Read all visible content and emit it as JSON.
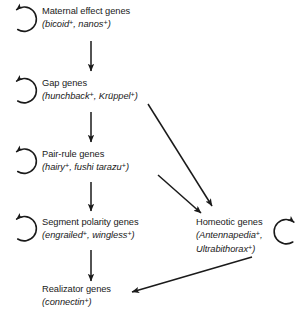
{
  "diagram": {
    "style": {
      "line_color": "#1a1a1a",
      "text_color": "#1a1a1a",
      "background": "#ffffff"
    },
    "nodes": [
      {
        "id": "maternal",
        "name": "maternal-effect-genes",
        "label": "Maternal effect genes",
        "genes_prefix": "(",
        "genes": "bicoid",
        "genes_sup": "+",
        "genes_mid": ", ",
        "genes2": "nanos",
        "genes2_sup": "+",
        "genes_suffix": ")",
        "genes_plain": "(bicoid+, nanos+)",
        "loop": "self-regulation-loop"
      },
      {
        "id": "gap",
        "name": "gap-genes",
        "label": "Gap genes",
        "genes_prefix": "(",
        "genes": "hunchback",
        "genes_sup": "+",
        "genes_mid": ", ",
        "genes2": "Krüppel",
        "genes2_sup": "+",
        "genes_suffix": ")",
        "genes_plain": "(hunchback+, Krüppel+)",
        "loop": "self-regulation-loop"
      },
      {
        "id": "pairrule",
        "name": "pair-rule-genes",
        "label": "Pair-rule genes",
        "genes_prefix": "(",
        "genes": "hairy",
        "genes_sup": "+",
        "genes_mid": ", ",
        "genes2": "fushi tarazu",
        "genes2_sup": "+",
        "genes_suffix": ")",
        "genes_plain": "(hairy+, fushi tarazu+)",
        "loop": "self-regulation-loop"
      },
      {
        "id": "segment",
        "name": "segment-polarity-genes",
        "label": "Segment polarity genes",
        "genes_prefix": "(",
        "genes": "engrailed",
        "genes_sup": "+",
        "genes_mid": ", ",
        "genes2": "wingless",
        "genes2_sup": "+",
        "genes_suffix": ")",
        "genes_plain": "(engrailed+, wingless+)",
        "loop": "self-regulation-loop"
      },
      {
        "id": "homeotic",
        "name": "homeotic-genes",
        "label": "Homeotic genes",
        "genes_prefix": "(",
        "genes": "Antennapedia",
        "genes_sup": "+",
        "genes_mid": ",",
        "genes2": "Ultrabithorax",
        "genes2_sup": "+",
        "genes_suffix": ")",
        "genes_plain": "(Antennapedia+, Ultrabithorax+)",
        "loop": "self-regulation-loop"
      },
      {
        "id": "realizator",
        "name": "realizator-genes",
        "label": "Realizator genes",
        "genes_prefix": "(",
        "genes": "connectin",
        "genes_sup": "+",
        "genes_mid": "",
        "genes2": "",
        "genes2_sup": "",
        "genes_suffix": ")",
        "genes_plain": "(connectin+)",
        "loop": "none"
      }
    ],
    "edges": [
      {
        "name": "arrow-maternal-to-gap",
        "from": "maternal",
        "to": "gap",
        "kind": "vertical"
      },
      {
        "name": "arrow-gap-to-pair-rule",
        "from": "gap",
        "to": "pairrule",
        "kind": "vertical"
      },
      {
        "name": "arrow-pair-rule-to-segment-polarity",
        "from": "pairrule",
        "to": "segment",
        "kind": "vertical"
      },
      {
        "name": "arrow-segment-polarity-to-realizator",
        "from": "segment",
        "to": "realizator",
        "kind": "vertical"
      },
      {
        "name": "arrow-gap-to-homeotic",
        "from": "gap",
        "to": "homeotic",
        "kind": "diagonal"
      },
      {
        "name": "arrow-pair-rule-to-homeotic",
        "from": "pairrule",
        "to": "homeotic",
        "kind": "diagonal"
      },
      {
        "name": "arrow-homeotic-to-realizator",
        "from": "homeotic",
        "to": "realizator",
        "kind": "diagonal"
      }
    ]
  }
}
